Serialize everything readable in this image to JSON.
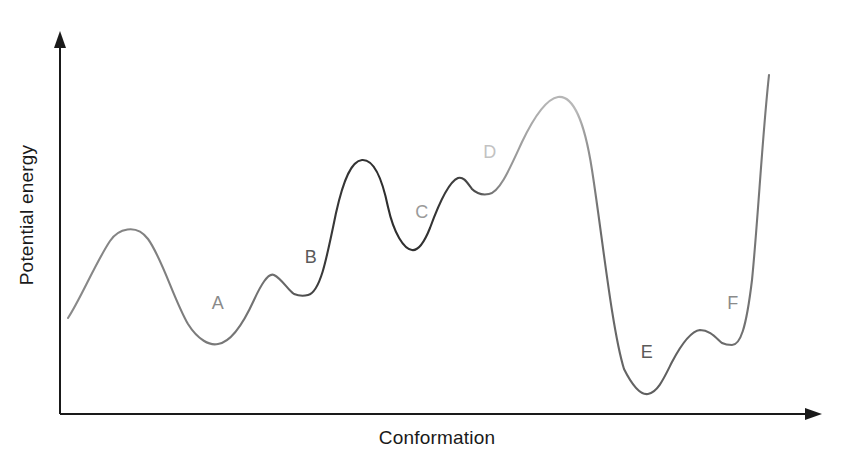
{
  "figure": {
    "background_color": "#ffffff",
    "axis_color": "#1a1a1a",
    "x_axis": {
      "label": "Conformation",
      "label_x": 437,
      "label_y": 444,
      "start_x": 60,
      "end_x": 822,
      "y": 414
    },
    "y_axis": {
      "label": "Potential energy",
      "label_x": 33,
      "label_y": 215,
      "x": 60,
      "top_y": 33,
      "bottom_y": 414
    }
  },
  "chart_data": {
    "type": "line",
    "title": "",
    "subtitle": "",
    "xlabel": "Conformation",
    "ylabel": "Potential energy",
    "xlim": [
      60,
      822
    ],
    "ylim": [
      414,
      33
    ],
    "grid": false,
    "legend": "none",
    "axes_have_tick_labels": false,
    "series": [
      {
        "name": "Potential energy profile",
        "stroke_width": 2.1,
        "gradient_stops": [
          {
            "offset": 0.0,
            "color": "#8a8a8a"
          },
          {
            "offset": 0.17,
            "color": "#7d7d7d"
          },
          {
            "offset": 0.3,
            "color": "#6e6e6e"
          },
          {
            "offset": 0.36,
            "color": "#3a3a3a"
          },
          {
            "offset": 0.45,
            "color": "#2e2e2e"
          },
          {
            "offset": 0.52,
            "color": "#333333"
          },
          {
            "offset": 0.58,
            "color": "#4a4a4a"
          },
          {
            "offset": 0.62,
            "color": "#8f8f8f"
          },
          {
            "offset": 0.68,
            "color": "#b4b4b4"
          },
          {
            "offset": 0.725,
            "color": "#b8b8b8"
          },
          {
            "offset": 0.76,
            "color": "#6a6a6a"
          },
          {
            "offset": 0.84,
            "color": "#5e5e5e"
          },
          {
            "offset": 0.93,
            "color": "#6a6a6a"
          },
          {
            "offset": 1.0,
            "color": "#7a7a7a"
          }
        ],
        "critical_points": [
          {
            "kind": "start",
            "x": 68,
            "y": 318
          },
          {
            "kind": "maximum",
            "x": 127,
            "y": 231
          },
          {
            "kind": "minimum",
            "x": 218,
            "y": 344,
            "well": "A"
          },
          {
            "kind": "maximum",
            "x": 272,
            "y": 275
          },
          {
            "kind": "minimum",
            "x": 308,
            "y": 295,
            "well": "B"
          },
          {
            "kind": "maximum",
            "x": 365,
            "y": 160
          },
          {
            "kind": "minimum",
            "x": 420,
            "y": 250,
            "well": "C"
          },
          {
            "kind": "maximum",
            "x": 462,
            "y": 178
          },
          {
            "kind": "minimum",
            "x": 489,
            "y": 194,
            "well": "D"
          },
          {
            "kind": "maximum",
            "x": 558,
            "y": 97
          },
          {
            "kind": "minimum",
            "x": 648,
            "y": 394,
            "well": "E"
          },
          {
            "kind": "maximum",
            "x": 700,
            "y": 330
          },
          {
            "kind": "minimum",
            "x": 732,
            "y": 345,
            "well": "F"
          },
          {
            "kind": "end",
            "x": 769,
            "y": 75
          }
        ],
        "path": "M 68 318 C 80 300 96 262 110 241 C 118 229 136 223 148 239 C 162 258 174 300 188 324 C 198 340 210 346 218 344 C 232 342 244 322 254 300 C 260 287 268 272 274 275 C 282 279 288 290 294 294 C 299 296 304 296 308 295 C 320 292 326 262 336 213 C 344 177 352 161 362 160 C 374 159 382 178 388 207 C 394 234 404 249 412 250 C 418 251 424 243 430 228 C 438 206 448 182 458 178 C 464 176 468 184 472 189 C 478 195 484 195 489 194 C 500 192 510 168 522 142 C 534 117 546 99 558 97 C 572 95 584 118 592 170 C 602 234 612 330 624 369 C 634 389 642 395 648 394 C 658 392 664 378 672 362 C 682 343 692 331 700 330 C 710 330 716 338 722 343 C 726 345 729 345 732 345 C 740 345 746 330 752 280 C 758 220 762 140 769 75"
      }
    ],
    "annotations": [
      {
        "label": "A",
        "x": 218,
        "y": 309,
        "color": "#8a8a8a"
      },
      {
        "label": "B",
        "x": 311,
        "y": 263,
        "color": "#5a5a5a"
      },
      {
        "label": "C",
        "x": 422,
        "y": 218,
        "color": "#9a9a9a"
      },
      {
        "label": "D",
        "x": 490,
        "y": 158,
        "color": "#c2c2c2"
      },
      {
        "label": "E",
        "x": 647,
        "y": 358,
        "color": "#5a5a5a"
      },
      {
        "label": "F",
        "x": 733,
        "y": 309,
        "color": "#8a8a8a"
      }
    ]
  }
}
